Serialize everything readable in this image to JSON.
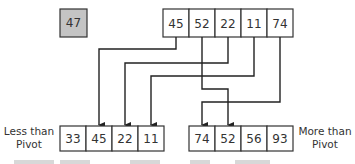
{
  "diagram": {
    "pivot": {
      "value": "47",
      "fill": "#c4c4c4"
    },
    "input_array": [
      "45",
      "52",
      "22",
      "11",
      "74"
    ],
    "less_than_pivot": {
      "label_line1": "Less than",
      "label_line2": "Pivot",
      "values": [
        "33",
        "45",
        "22",
        "11"
      ]
    },
    "more_than_pivot": {
      "label_line1": "More than",
      "label_line2": "Pivot",
      "values": [
        "74",
        "52",
        "56",
        "93"
      ]
    },
    "arrows": [
      {
        "from": "45",
        "to_group": "less",
        "to_index": 1
      },
      {
        "from": "22",
        "to_group": "less",
        "to_index": 2
      },
      {
        "from": "11",
        "to_group": "less",
        "to_index": 3
      },
      {
        "from": "52",
        "to_group": "more",
        "to_index": 1
      },
      {
        "from": "74",
        "to_group": "more",
        "to_index": 0
      }
    ],
    "colors": {
      "line": "#222222",
      "cell_border": "#333333",
      "cell_fill": "#ffffff"
    }
  }
}
